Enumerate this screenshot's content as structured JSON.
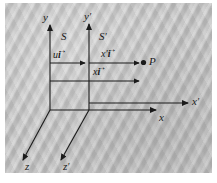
{
  "figure": {
    "type": "galilean-reference-frames-diagram",
    "background_color": "#bfbfbf",
    "line_color": "#1a1a1a",
    "axes": [
      {
        "name": "y",
        "label": "y",
        "frame": "S",
        "orientation": "vertical"
      },
      {
        "name": "yp",
        "label": "y",
        "prime": "′",
        "frame": "S′",
        "orientation": "vertical"
      },
      {
        "name": "x",
        "label": "x",
        "frame": "S",
        "orientation": "horizontal"
      },
      {
        "name": "xp",
        "label": "x",
        "prime": "′",
        "frame": "S′",
        "orientation": "horizontal"
      },
      {
        "name": "z",
        "label": "z",
        "frame": "S",
        "orientation": "diagonal"
      },
      {
        "name": "zp",
        "label": "z",
        "prime": "′",
        "frame": "S′",
        "orientation": "diagonal"
      }
    ],
    "frames": [
      {
        "name": "S",
        "label": "S"
      },
      {
        "name": "Sp",
        "label": "S",
        "prime": "′"
      }
    ],
    "vectors": [
      {
        "name": "u-ihat",
        "scalar": "u",
        "unit": "i",
        "prime": "",
        "arrow": "→",
        "description": "displacement of frame S′ relative to S"
      },
      {
        "name": "xprime-ihat",
        "scalar": "x",
        "unit": "i",
        "prime": "′",
        "arrow": "→",
        "description": "position of P in frame S′"
      },
      {
        "name": "x-ihat",
        "scalar": "x",
        "unit": "i",
        "prime": "",
        "arrow": "→",
        "description": "position of P in frame S"
      }
    ],
    "points": [
      {
        "name": "P",
        "label": "P",
        "marker": "filled-dot"
      }
    ]
  }
}
